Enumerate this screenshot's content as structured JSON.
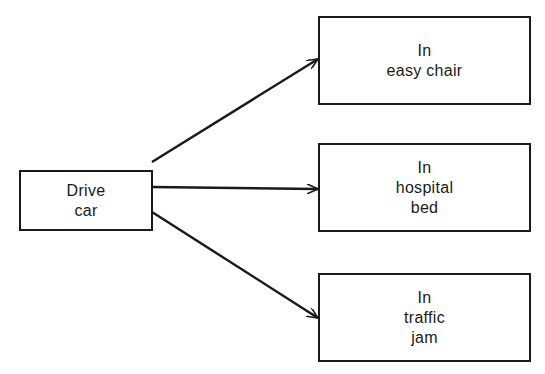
{
  "diagram": {
    "type": "flow",
    "source": {
      "id": "drive-car",
      "lines": [
        "Drive",
        "car"
      ]
    },
    "outcomes": [
      {
        "id": "easy-chair",
        "lines": [
          "In",
          "easy chair"
        ]
      },
      {
        "id": "hospital-bed",
        "lines": [
          "In",
          "hospital",
          "bed"
        ]
      },
      {
        "id": "traffic-jam",
        "lines": [
          "In",
          "traffic",
          "jam"
        ]
      }
    ],
    "edges": [
      {
        "from": "drive-car",
        "to": "easy-chair"
      },
      {
        "from": "drive-car",
        "to": "hospital-bed"
      },
      {
        "from": "drive-car",
        "to": "traffic-jam"
      }
    ],
    "colors": {
      "stroke": "#1a1a1a",
      "background": "#ffffff"
    }
  }
}
